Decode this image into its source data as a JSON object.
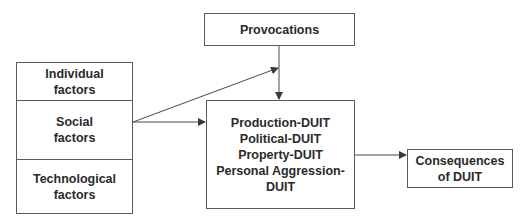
{
  "diagram": {
    "factors": [
      {
        "label": "Individual\nfactors"
      },
      {
        "label": "Social\nfactors"
      },
      {
        "label": "Technological\nfactors"
      }
    ],
    "provocations": {
      "label": "Provocations"
    },
    "duit_types": {
      "label": "Production-DUIT\nPolitical-DUIT\nProperty-DUIT\nPersonal Aggression-\nDUIT"
    },
    "consequences": {
      "label": "Consequences\nof DUIT"
    },
    "edges": [
      {
        "from": "Social factors",
        "to": "DUIT types"
      },
      {
        "from": "Social factors",
        "to": "Provocations edge"
      },
      {
        "from": "Provocations",
        "to": "DUIT types"
      },
      {
        "from": "DUIT types",
        "to": "Consequences of DUIT"
      }
    ],
    "colors": {
      "line": "#4a4a4a",
      "text": "#2a2a2a",
      "background": "#ffffff"
    }
  }
}
